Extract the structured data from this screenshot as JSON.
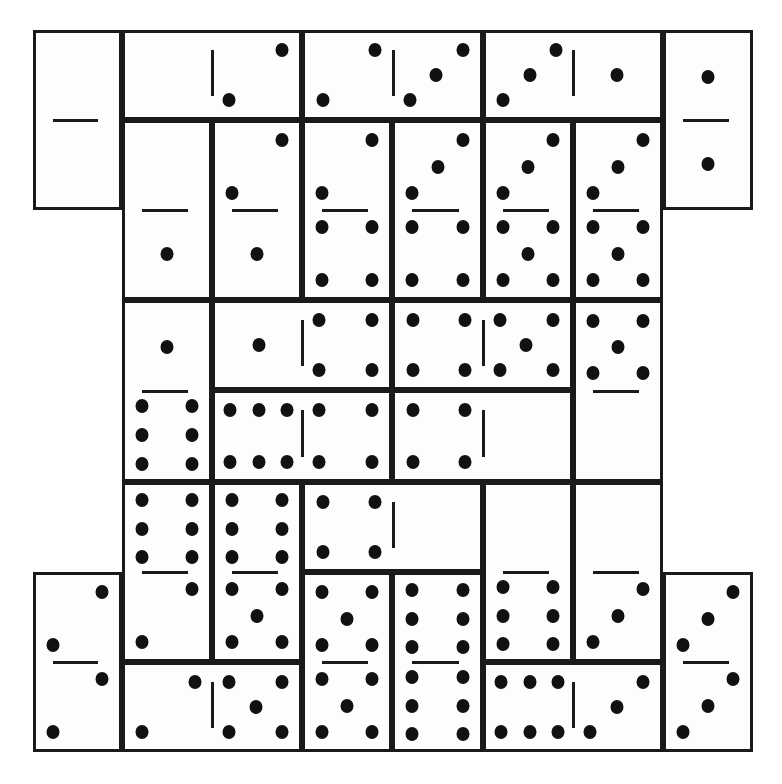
{
  "puzzle": {
    "title": "Domino arrangement",
    "grid": {
      "col_edges": [
        33,
        122,
        212,
        302,
        392,
        483,
        573,
        663,
        753
      ],
      "row_edges": [
        30,
        120,
        210,
        300,
        390,
        482,
        572,
        662,
        752
      ]
    },
    "colors": {
      "line": "#1a1a1a",
      "pip": "#111111",
      "face": "#fdfdfd"
    },
    "dominoes": [
      {
        "id": "d1",
        "c": 0,
        "r": 0,
        "w": 1,
        "h": 2,
        "a": 0,
        "b": 0
      },
      {
        "id": "d2",
        "c": 1,
        "r": 0,
        "w": 2,
        "h": 1,
        "a": 0,
        "b": 2
      },
      {
        "id": "d3",
        "c": 3,
        "r": 0,
        "w": 2,
        "h": 1,
        "a": 2,
        "b": 3
      },
      {
        "id": "d4",
        "c": 5,
        "r": 0,
        "w": 2,
        "h": 1,
        "a": 3,
        "b": 1
      },
      {
        "id": "d5",
        "c": 7,
        "r": 0,
        "w": 1,
        "h": 2,
        "a": 1,
        "b": 1
      },
      {
        "id": "d6",
        "c": 1,
        "r": 1,
        "w": 1,
        "h": 2,
        "a": 0,
        "b": 1
      },
      {
        "id": "d7",
        "c": 2,
        "r": 1,
        "w": 1,
        "h": 2,
        "a": 2,
        "b": 1
      },
      {
        "id": "d8",
        "c": 3,
        "r": 1,
        "w": 1,
        "h": 2,
        "a": 2,
        "b": 4
      },
      {
        "id": "d9",
        "c": 4,
        "r": 1,
        "w": 1,
        "h": 2,
        "a": 3,
        "b": 4
      },
      {
        "id": "d10",
        "c": 5,
        "r": 1,
        "w": 1,
        "h": 2,
        "a": 3,
        "b": 5
      },
      {
        "id": "d11",
        "c": 6,
        "r": 1,
        "w": 1,
        "h": 2,
        "a": 3,
        "b": 5
      },
      {
        "id": "d12",
        "c": 1,
        "r": 3,
        "w": 1,
        "h": 2,
        "a": 1,
        "b": 6
      },
      {
        "id": "d13",
        "c": 2,
        "r": 3,
        "w": 2,
        "h": 1,
        "a": 1,
        "b": 4
      },
      {
        "id": "d14",
        "c": 4,
        "r": 3,
        "w": 2,
        "h": 1,
        "a": 4,
        "b": 5
      },
      {
        "id": "d15",
        "c": 6,
        "r": 3,
        "w": 1,
        "h": 2,
        "a": 5,
        "b": 0
      },
      {
        "id": "d16",
        "c": 2,
        "r": 4,
        "w": 2,
        "h": 1,
        "a": 6,
        "b": 4
      },
      {
        "id": "d17",
        "c": 4,
        "r": 4,
        "w": 2,
        "h": 1,
        "a": 4,
        "b": 0
      },
      {
        "id": "d18",
        "c": 1,
        "r": 5,
        "w": 1,
        "h": 2,
        "a": 6,
        "b": 2
      },
      {
        "id": "d19",
        "c": 2,
        "r": 5,
        "w": 1,
        "h": 2,
        "a": 6,
        "b": 5
      },
      {
        "id": "d20",
        "c": 3,
        "r": 5,
        "w": 2,
        "h": 1,
        "a": 4,
        "b": 0
      },
      {
        "id": "d21",
        "c": 5,
        "r": 5,
        "w": 1,
        "h": 2,
        "a": 0,
        "b": 6
      },
      {
        "id": "d22",
        "c": 6,
        "r": 5,
        "w": 1,
        "h": 2,
        "a": 0,
        "b": 3
      },
      {
        "id": "d23",
        "c": 0,
        "r": 6,
        "w": 1,
        "h": 2,
        "a": 2,
        "b": 2
      },
      {
        "id": "d24",
        "c": 3,
        "r": 6,
        "w": 1,
        "h": 2,
        "a": 5,
        "b": 5
      },
      {
        "id": "d25",
        "c": 4,
        "r": 6,
        "w": 1,
        "h": 2,
        "a": 6,
        "b": 6
      },
      {
        "id": "d26",
        "c": 7,
        "r": 6,
        "w": 1,
        "h": 2,
        "a": 3,
        "b": 3
      },
      {
        "id": "d27",
        "c": 1,
        "r": 7,
        "w": 2,
        "h": 1,
        "a": 2,
        "b": 5
      },
      {
        "id": "d28",
        "c": 5,
        "r": 7,
        "w": 2,
        "h": 1,
        "a": 6,
        "b": 3
      }
    ]
  }
}
